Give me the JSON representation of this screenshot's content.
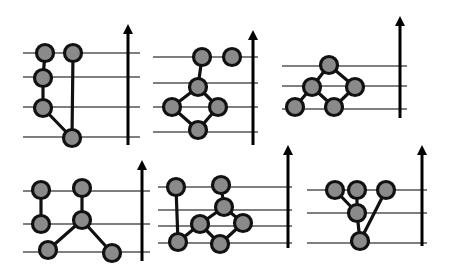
{
  "figure": {
    "colors": {
      "node_fill": "#8a8a8a",
      "node_stroke": "#111111",
      "edge": "#111111",
      "level_line": "#555555",
      "arrow": "#000000",
      "background": "#ffffff"
    },
    "panels": [
      {
        "id": "panel-1",
        "levels": [
          53,
          77,
          107,
          137
        ],
        "line_x": [
          23,
          140
        ],
        "arrow": {
          "x": 128,
          "y1": 145,
          "y2": 24
        },
        "nodes": [
          [
            45,
            53
          ],
          [
            73,
            53
          ],
          [
            43,
            78
          ],
          [
            43,
            108
          ],
          [
            72,
            138
          ]
        ],
        "edges": [
          [
            0,
            2
          ],
          [
            2,
            3
          ],
          [
            3,
            4
          ],
          [
            1,
            4
          ]
        ]
      },
      {
        "id": "panel-2",
        "levels": [
          57,
          83,
          107,
          132
        ],
        "line_x": [
          153,
          258
        ],
        "arrow": {
          "x": 253,
          "y1": 145,
          "y2": 30
        },
        "nodes": [
          [
            202,
            57
          ],
          [
            232,
            57
          ],
          [
            198,
            87
          ],
          [
            172,
            107
          ],
          [
            218,
            107
          ],
          [
            198,
            130
          ]
        ],
        "edges": [
          [
            0,
            2
          ],
          [
            2,
            3
          ],
          [
            2,
            4
          ],
          [
            3,
            5
          ],
          [
            4,
            5
          ]
        ]
      },
      {
        "id": "panel-3",
        "levels": [
          66,
          86,
          109
        ],
        "line_x": [
          282,
          407
        ],
        "arrow": {
          "x": 400,
          "y1": 118,
          "y2": 16
        },
        "nodes": [
          [
            329,
            65
          ],
          [
            312,
            87
          ],
          [
            355,
            87
          ],
          [
            295,
            107
          ],
          [
            334,
            107
          ]
        ],
        "edges": [
          [
            0,
            1
          ],
          [
            0,
            2
          ],
          [
            1,
            3
          ],
          [
            1,
            4
          ],
          [
            2,
            4
          ]
        ]
      },
      {
        "id": "panel-4",
        "levels": [
          191,
          224,
          252
        ],
        "line_x": [
          23,
          150
        ],
        "arrow": {
          "x": 142,
          "y1": 261,
          "y2": 160
        },
        "nodes": [
          [
            41,
            190
          ],
          [
            82,
            188
          ],
          [
            41,
            224
          ],
          [
            82,
            220
          ],
          [
            48,
            250
          ],
          [
            112,
            253
          ]
        ],
        "edges": [
          [
            0,
            2
          ],
          [
            1,
            3
          ],
          [
            3,
            4
          ],
          [
            3,
            5
          ]
        ]
      },
      {
        "id": "panel-5",
        "levels": [
          187,
          210,
          226,
          243
        ],
        "line_x": [
          158,
          292
        ],
        "arrow": {
          "x": 288,
          "y1": 248,
          "y2": 145
        },
        "nodes": [
          [
            176,
            187
          ],
          [
            221,
            185
          ],
          [
            224,
            207
          ],
          [
            200,
            224
          ],
          [
            243,
            223
          ],
          [
            178,
            242
          ],
          [
            220,
            244
          ]
        ],
        "edges": [
          [
            0,
            5
          ],
          [
            1,
            2
          ],
          [
            2,
            3
          ],
          [
            2,
            4
          ],
          [
            3,
            5
          ],
          [
            3,
            6
          ],
          [
            4,
            6
          ]
        ]
      },
      {
        "id": "panel-6",
        "levels": [
          190,
          213,
          243
        ],
        "line_x": [
          307,
          427
        ],
        "arrow": {
          "x": 422,
          "y1": 246,
          "y2": 145
        },
        "nodes": [
          [
            335,
            190
          ],
          [
            357,
            190
          ],
          [
            386,
            190
          ],
          [
            357,
            213
          ],
          [
            360,
            241
          ]
        ],
        "edges": [
          [
            0,
            3
          ],
          [
            1,
            3
          ],
          [
            3,
            4
          ],
          [
            2,
            4
          ]
        ]
      }
    ]
  }
}
